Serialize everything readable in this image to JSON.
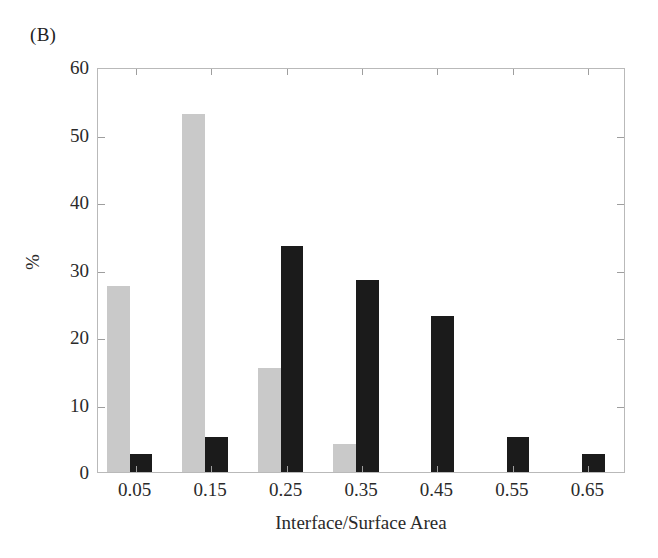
{
  "figure": {
    "panel_label": "(B)"
  },
  "chart_data": {
    "type": "bar",
    "title": "",
    "xlabel": "Interface/Surface Area",
    "ylabel": "%",
    "categories": [
      "0.05",
      "0.15",
      "0.25",
      "0.35",
      "0.45",
      "0.55",
      "0.65"
    ],
    "series": [
      {
        "name": "gray",
        "color": "#c9c9c9",
        "values": [
          27.5,
          53.0,
          15.4,
          4.2,
          0,
          0,
          0
        ]
      },
      {
        "name": "black",
        "color": "#1b1b1b",
        "values": [
          2.7,
          5.2,
          33.5,
          28.4,
          23.1,
          5.2,
          2.7
        ]
      }
    ],
    "ylim": [
      0,
      60
    ],
    "yticks": [
      0,
      10,
      20,
      30,
      40,
      50,
      60
    ],
    "ytick_labels": [
      "0",
      "10",
      "20",
      "30",
      "40",
      "50",
      "60"
    ],
    "xtick_labels": [
      "0.05",
      "0.15",
      "0.25",
      "0.35",
      "0.45",
      "0.55",
      "0.65"
    ],
    "grid": false,
    "legend": "none"
  }
}
